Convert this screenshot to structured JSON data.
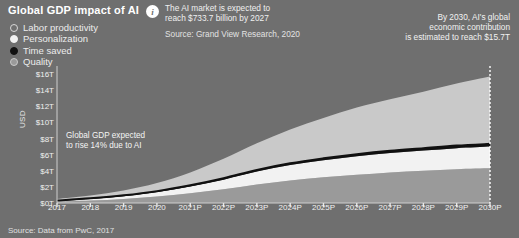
{
  "header": {
    "title": "Global GDP impact of AI",
    "info_icon": "info-icon",
    "info_line1": "The AI market is expected to",
    "info_line2": "reach $733.7 billion by 2027",
    "info_source": "Source: Grand View Research, 2020"
  },
  "legend": {
    "items": [
      {
        "label": "Labor productivity",
        "marker": "ring-circle",
        "color": "#d8d8d8"
      },
      {
        "label": "Personalization",
        "marker": "filled-circle",
        "color": "#f2f2f2"
      },
      {
        "label": "Time saved",
        "marker": "filled-circle",
        "color": "#111111"
      },
      {
        "label": "Quality",
        "marker": "ring-circle",
        "color": "#9a9a9a"
      }
    ]
  },
  "callout": {
    "line1": "By 2030, AI's global",
    "line2": "economic contribution",
    "line3": "is estimated to reach $15.7T"
  },
  "annotation": {
    "line1": "Global GDP expected",
    "line2": "to rise 14% due to AI"
  },
  "footer": {
    "source": "Source: Data from PwC, 2017"
  },
  "chart_data": {
    "type": "area",
    "title": "Global GDP impact of AI",
    "xlabel": "",
    "ylabel": "USD",
    "grid": false,
    "legend_position": "top-left",
    "ylim": [
      0,
      17
    ],
    "yticks": [
      "$0T",
      "$2T",
      "$4T",
      "$6T",
      "$8T",
      "$10T",
      "$12T",
      "$14T",
      "$16T"
    ],
    "ytick_values": [
      0,
      2,
      4,
      6,
      8,
      10,
      12,
      14,
      16
    ],
    "categories": [
      "2017",
      "2018",
      "2019",
      "2020",
      "2021P",
      "2022P",
      "2023P",
      "2024P",
      "2025P",
      "2026P",
      "2027P",
      "2028P",
      "2029P",
      "2030P"
    ],
    "stacked": true,
    "series": [
      {
        "name": "Quality",
        "color": "#9a9a9a",
        "values": [
          0.15,
          0.3,
          0.5,
          0.8,
          1.2,
          1.7,
          2.3,
          2.8,
          3.2,
          3.5,
          3.8,
          4.0,
          4.2,
          4.3
        ]
      },
      {
        "name": "Personalization",
        "color": "#f2f2f2",
        "values": [
          0.1,
          0.2,
          0.35,
          0.55,
          0.85,
          1.2,
          1.6,
          1.9,
          2.1,
          2.3,
          2.4,
          2.5,
          2.6,
          2.7
        ]
      },
      {
        "name": "Time saved",
        "color": "#111111",
        "values": [
          0.05,
          0.08,
          0.1,
          0.12,
          0.15,
          0.18,
          0.2,
          0.22,
          0.24,
          0.26,
          0.28,
          0.3,
          0.32,
          0.34
        ]
      },
      {
        "name": "Labor productivity",
        "color": "#c9c9c9",
        "values": [
          0.2,
          0.35,
          0.6,
          1.0,
          1.6,
          2.4,
          3.3,
          4.2,
          5.0,
          5.8,
          6.4,
          7.0,
          7.7,
          8.36
        ]
      }
    ],
    "totals": [
      0.5,
      0.93,
      1.55,
      2.47,
      3.8,
      5.48,
      7.4,
      9.12,
      10.54,
      11.86,
      12.88,
      13.8,
      14.82,
      15.7
    ],
    "annotations": [
      {
        "text": "Global GDP expected to rise 14% due to AI",
        "x": "2021P",
        "y": 8
      },
      {
        "text": "By 2030, AI's global economic contribution is estimated to reach $15.7T",
        "x": "2030P",
        "y": 16
      }
    ],
    "marker_line_2030": true
  }
}
